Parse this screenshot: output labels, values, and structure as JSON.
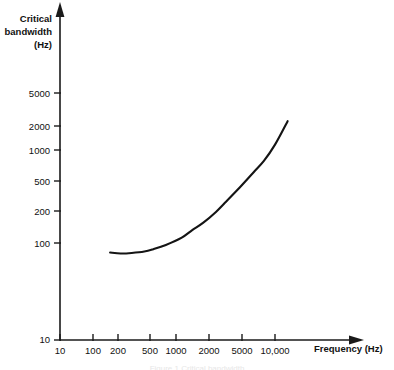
{
  "figure": {
    "y_axis_title_lines": [
      "Critical",
      "bandwidth",
      "(Hz)"
    ],
    "x_axis_title": "Frequency (Hz)",
    "caption": "Figure 1 Critical bandwidth"
  },
  "chart_data": {
    "type": "line",
    "title": "",
    "subtitle": "",
    "xlabel": "Frequency (Hz)",
    "ylabel": "Critical bandwidth (Hz)",
    "xscale": "log",
    "yscale": "log",
    "xlim": [
      10,
      20000
    ],
    "ylim": [
      10,
      10000
    ],
    "grid": false,
    "legend": null,
    "xticks": [
      10,
      100,
      200,
      500,
      1000,
      2000,
      5000,
      10000
    ],
    "xticklabels": [
      "10",
      "100",
      "200",
      "500",
      "1000",
      "2000",
      "5000",
      "10,000"
    ],
    "yticks": [
      10,
      100,
      200,
      500,
      1000,
      2000,
      5000
    ],
    "yticklabels": [
      "10",
      "100",
      "200",
      "500",
      "1000",
      "2000",
      "5000"
    ],
    "series": [
      {
        "name": "Critical bandwidth",
        "x": [
          50,
          70,
          100,
          150,
          200,
          300,
          500,
          700,
          1000,
          1500,
          2000,
          3000,
          5000,
          7000,
          10000,
          15000
        ],
        "y": [
          78,
          76,
          77,
          80,
          85,
          95,
          115,
          140,
          170,
          225,
          285,
          400,
          630,
          850,
          1300,
          2400
        ]
      }
    ],
    "annotations": []
  },
  "axes_pixels": {
    "note": "",
    "x_ticks_px": [
      60,
      93,
      118,
      150,
      176,
      209,
      242,
      275
    ],
    "y_ticks_px": [
      340,
      243,
      211,
      181,
      150,
      126,
      93
    ],
    "origin_px": [
      60,
      340
    ]
  }
}
